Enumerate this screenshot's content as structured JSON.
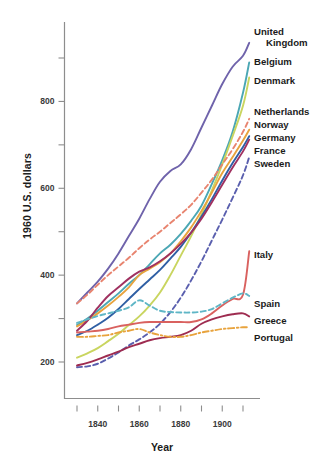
{
  "chart_data": {
    "type": "line",
    "title": "",
    "xlabel": "Year",
    "ylabel": "1960 U.S. dollars",
    "xlim": [
      1830,
      1913
    ],
    "ylim": [
      150,
      960
    ],
    "grid": false,
    "legend_position": "right-inline-labels",
    "x_major_ticks": [
      1840,
      1860,
      1880,
      1900
    ],
    "x_all_ticks": [
      1830,
      1840,
      1850,
      1860,
      1870,
      1880,
      1890,
      1900,
      1910
    ],
    "y_major_ticks": [
      200,
      400,
      600,
      800
    ],
    "y_all_ticks": [
      200,
      300,
      400,
      500,
      600,
      700,
      800,
      900
    ],
    "x_tick_labels": [
      "1840",
      "1860",
      "1880",
      "1900"
    ],
    "y_tick_labels": [
      "200",
      "400",
      "600",
      "800"
    ],
    "series": [
      {
        "name": "United Kingdom",
        "label": "United Kingdom",
        "label_lines": [
          "United",
          "Kingdom"
        ],
        "color": "#6f63ab",
        "style": "solid",
        "x": [
          1830,
          1835,
          1840,
          1845,
          1850,
          1855,
          1860,
          1865,
          1870,
          1875,
          1880,
          1885,
          1890,
          1895,
          1900,
          1905,
          1910,
          1913
        ],
        "values": [
          335,
          360,
          385,
          415,
          450,
          490,
          530,
          575,
          615,
          640,
          655,
          690,
          740,
          790,
          840,
          880,
          905,
          935
        ]
      },
      {
        "name": "Belgium",
        "label": "Belgium",
        "color": "#4ba7b4",
        "style": "solid",
        "x": [
          1830,
          1835,
          1840,
          1845,
          1850,
          1855,
          1860,
          1865,
          1870,
          1875,
          1880,
          1885,
          1890,
          1895,
          1900,
          1905,
          1910,
          1913
        ],
        "values": [
          285,
          300,
          318,
          338,
          358,
          380,
          400,
          425,
          450,
          470,
          495,
          525,
          560,
          610,
          665,
          730,
          820,
          890
        ]
      },
      {
        "name": "Denmark",
        "label": "Denmark",
        "color": "#c9d55f",
        "style": "solid",
        "x": [
          1830,
          1835,
          1840,
          1845,
          1850,
          1855,
          1860,
          1865,
          1870,
          1875,
          1880,
          1885,
          1890,
          1895,
          1900,
          1905,
          1910,
          1913
        ],
        "values": [
          210,
          220,
          232,
          248,
          265,
          285,
          305,
          330,
          360,
          400,
          445,
          490,
          540,
          595,
          655,
          720,
          790,
          855
        ]
      },
      {
        "name": "Netherlands",
        "label": "Netherlands",
        "color": "#e8846f",
        "style": "dashed",
        "x": [
          1830,
          1835,
          1840,
          1845,
          1850,
          1855,
          1860,
          1865,
          1870,
          1875,
          1880,
          1885,
          1890,
          1895,
          1900,
          1905,
          1910,
          1913
        ],
        "values": [
          335,
          355,
          378,
          400,
          420,
          440,
          462,
          482,
          500,
          520,
          540,
          562,
          590,
          620,
          655,
          690,
          730,
          760
        ]
      },
      {
        "name": "Norway",
        "label": "Norway",
        "color": "#e8a33d",
        "style": "solid",
        "x": [
          1830,
          1835,
          1840,
          1845,
          1850,
          1855,
          1860,
          1865,
          1870,
          1875,
          1880,
          1885,
          1890,
          1895,
          1900,
          1905,
          1910,
          1913
        ],
        "values": [
          282,
          296,
          312,
          330,
          350,
          372,
          400,
          415,
          430,
          450,
          478,
          510,
          548,
          590,
          635,
          672,
          710,
          735
        ]
      },
      {
        "name": "Germany",
        "label": "Germany",
        "color": "#2f5fa4",
        "style": "solid",
        "x": [
          1830,
          1835,
          1840,
          1845,
          1850,
          1855,
          1860,
          1865,
          1870,
          1875,
          1880,
          1885,
          1890,
          1895,
          1900,
          1905,
          1910,
          1913
        ],
        "values": [
          262,
          272,
          286,
          302,
          322,
          345,
          368,
          390,
          412,
          438,
          465,
          498,
          535,
          575,
          618,
          658,
          695,
          720
        ]
      },
      {
        "name": "France",
        "label": "France",
        "color": "#a03160",
        "style": "solid",
        "x": [
          1830,
          1835,
          1840,
          1845,
          1850,
          1855,
          1860,
          1865,
          1870,
          1875,
          1880,
          1885,
          1890,
          1895,
          1900,
          1905,
          1910,
          1913
        ],
        "values": [
          272,
          295,
          325,
          352,
          372,
          392,
          408,
          418,
          432,
          450,
          472,
          498,
          530,
          568,
          608,
          648,
          685,
          712
        ]
      },
      {
        "name": "Sweden",
        "label": "Sweden",
        "color": "#5a5fae",
        "style": "dashed",
        "x": [
          1830,
          1835,
          1840,
          1845,
          1850,
          1855,
          1860,
          1865,
          1870,
          1875,
          1880,
          1885,
          1890,
          1895,
          1900,
          1905,
          1910,
          1913
        ],
        "values": [
          188,
          190,
          196,
          208,
          222,
          238,
          252,
          268,
          288,
          315,
          348,
          388,
          432,
          480,
          528,
          578,
          630,
          672
        ]
      },
      {
        "name": "Italy",
        "label": "Italy",
        "color": "#d9615f",
        "style": "solid",
        "x": [
          1830,
          1835,
          1840,
          1845,
          1850,
          1855,
          1860,
          1865,
          1870,
          1875,
          1880,
          1885,
          1890,
          1895,
          1900,
          1905,
          1910,
          1913
        ],
        "values": [
          268,
          270,
          272,
          276,
          282,
          286,
          290,
          292,
          292,
          292,
          292,
          292,
          298,
          312,
          330,
          345,
          355,
          455
        ]
      },
      {
        "name": "Spain",
        "label": "Spain",
        "color": "#5fb6c6",
        "style": "dashed",
        "x": [
          1830,
          1835,
          1840,
          1845,
          1850,
          1855,
          1860,
          1865,
          1870,
          1875,
          1880,
          1885,
          1890,
          1895,
          1900,
          1905,
          1910,
          1913
        ],
        "values": [
          290,
          298,
          306,
          312,
          318,
          326,
          342,
          330,
          318,
          315,
          314,
          314,
          316,
          322,
          335,
          348,
          358,
          352
        ]
      },
      {
        "name": "Greece",
        "label": "Greece",
        "color": "#9e2c50",
        "style": "solid",
        "x": [
          1830,
          1835,
          1840,
          1845,
          1850,
          1855,
          1860,
          1865,
          1870,
          1875,
          1880,
          1885,
          1890,
          1895,
          1900,
          1905,
          1910,
          1913
        ],
        "values": [
          192,
          198,
          206,
          215,
          224,
          234,
          242,
          250,
          255,
          258,
          262,
          272,
          288,
          298,
          305,
          310,
          312,
          305
        ]
      },
      {
        "name": "Portugal",
        "label": "Portugal",
        "color": "#e8a33d",
        "style": "dashdot",
        "x": [
          1830,
          1835,
          1840,
          1845,
          1850,
          1855,
          1860,
          1865,
          1870,
          1875,
          1880,
          1885,
          1890,
          1895,
          1900,
          1905,
          1910,
          1913
        ],
        "values": [
          258,
          258,
          260,
          262,
          268,
          272,
          276,
          268,
          262,
          258,
          258,
          262,
          268,
          272,
          276,
          278,
          280,
          280
        ]
      }
    ]
  },
  "labels": {
    "united_kingdom_line1": "United",
    "united_kingdom_line2": "Kingdom",
    "belgium": "Belgium",
    "denmark": "Denmark",
    "netherlands": "Netherlands",
    "norway": "Norway",
    "germany": "Germany",
    "france": "France",
    "sweden": "Sweden",
    "italy": "Italy",
    "spain": "Spain",
    "greece": "Greece",
    "portugal": "Portugal"
  },
  "axes": {
    "y_title": "1960 U.S. dollars",
    "x_title": "Year",
    "y_ticks": [
      "800",
      "600",
      "400",
      "200"
    ],
    "x_ticks": [
      "1840",
      "1860",
      "1880",
      "1900"
    ]
  }
}
